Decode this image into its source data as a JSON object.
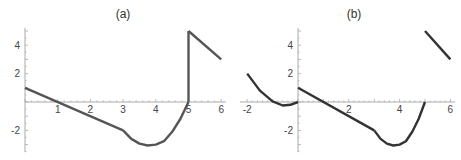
{
  "chart_data": [
    {
      "type": "line",
      "title": "(a)",
      "xlabel": "",
      "ylabel": "",
      "xlim": [
        0,
        6.1
      ],
      "ylim": [
        -3.6,
        5.2
      ],
      "x_ticks": [
        "1",
        "2",
        "3",
        "4",
        "5",
        "6"
      ],
      "y_ticks": [
        "4",
        "2",
        "-2"
      ],
      "grid": false,
      "color": "#555555",
      "series": [
        {
          "name": "segment-linear",
          "points": [
            [
              0,
              1
            ],
            [
              3,
              -2
            ]
          ]
        },
        {
          "name": "segment-curve",
          "points": [
            [
              3,
              -2
            ],
            [
              3.25,
              -2.6
            ],
            [
              3.5,
              -2.93
            ],
            [
              3.75,
              -3.06
            ],
            [
              4,
              -3
            ],
            [
              4.25,
              -2.76
            ],
            [
              4.5,
              -2.1
            ],
            [
              4.75,
              -1.2
            ],
            [
              5,
              0
            ]
          ]
        },
        {
          "name": "vertical-jump",
          "points": [
            [
              5,
              0
            ],
            [
              5,
              5
            ]
          ]
        },
        {
          "name": "segment-linear-2",
          "points": [
            [
              5,
              5
            ],
            [
              6,
              3
            ]
          ]
        }
      ]
    },
    {
      "type": "line",
      "title": "(b)",
      "xlabel": "",
      "ylabel": "",
      "xlim": [
        -2.1,
        6.1
      ],
      "ylim": [
        -3.6,
        5.2
      ],
      "x_ticks": [
        "-2",
        "2",
        "4",
        "6"
      ],
      "y_ticks": [
        "4",
        "2",
        "-2"
      ],
      "grid": false,
      "color": "#333333",
      "series": [
        {
          "name": "segment-left-curve",
          "points": [
            [
              -2,
              2
            ],
            [
              -1.5,
              0.8
            ],
            [
              -1,
              0.05
            ],
            [
              -0.6,
              -0.25
            ],
            [
              -0.3,
              -0.2
            ],
            [
              0,
              0
            ]
          ]
        },
        {
          "name": "segment-linear",
          "points": [
            [
              0,
              1
            ],
            [
              3,
              -2
            ]
          ]
        },
        {
          "name": "segment-curve",
          "points": [
            [
              3,
              -2
            ],
            [
              3.25,
              -2.6
            ],
            [
              3.5,
              -2.93
            ],
            [
              3.75,
              -3.06
            ],
            [
              4,
              -3
            ],
            [
              4.25,
              -2.76
            ],
            [
              4.5,
              -2.1
            ],
            [
              4.75,
              -1.2
            ],
            [
              5,
              0
            ]
          ]
        },
        {
          "name": "segment-linear-2",
          "points": [
            [
              5,
              5
            ],
            [
              6,
              3
            ]
          ]
        }
      ]
    }
  ]
}
